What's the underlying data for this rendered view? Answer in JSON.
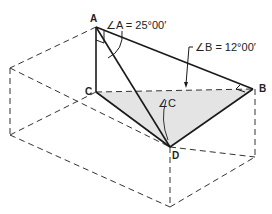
{
  "diagram": {
    "type": "isometric-geometry",
    "points": {
      "A": {
        "label": "A"
      },
      "B": {
        "label": "B"
      },
      "C": {
        "label": "C"
      },
      "D": {
        "label": "D"
      }
    },
    "annotations": {
      "angle_a": "∠A = 25°00′",
      "angle_b": "∠B = 12°00′",
      "angle_c": "∠C"
    },
    "colors": {
      "line": "#1a1a1a",
      "dashed": "#333333",
      "shade": "#e4e4e4"
    }
  }
}
